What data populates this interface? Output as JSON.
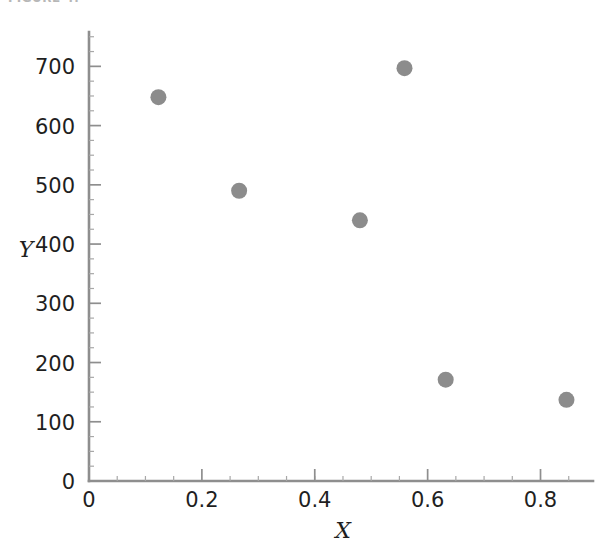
{
  "figure": {
    "caption_fragment": "FIGURE  4.",
    "background_color": "#ffffff"
  },
  "chart_data": {
    "type": "scatter",
    "title": "",
    "xlabel": "X",
    "ylabel": "Y",
    "xlim": [
      0,
      0.893
    ],
    "ylim": [
      0,
      758
    ],
    "grid": false,
    "legend": "none",
    "marker": {
      "shape": "circle",
      "color": "#8c8c8c",
      "radius_px": 8
    },
    "xticks": [
      "0",
      "0.2",
      "0.4",
      "0.6",
      "0.8"
    ],
    "xtick_values": [
      0,
      0.2,
      0.4,
      0.6,
      0.8
    ],
    "xtick_minor_step": 0.05,
    "yticks": [
      "0",
      "100",
      "200",
      "300",
      "400",
      "500",
      "600",
      "700"
    ],
    "ytick_values": [
      0,
      100,
      200,
      300,
      400,
      500,
      600,
      700
    ],
    "ytick_minor_step": 25,
    "x": [
      0.123,
      0.266,
      0.48,
      0.559,
      0.632,
      0.846
    ],
    "y": [
      648,
      490,
      440,
      697,
      171,
      137
    ],
    "points": [
      {
        "x": 0.123,
        "y": 648
      },
      {
        "x": 0.266,
        "y": 490
      },
      {
        "x": 0.48,
        "y": 440
      },
      {
        "x": 0.559,
        "y": 697
      },
      {
        "x": 0.632,
        "y": 171
      },
      {
        "x": 0.846,
        "y": 137
      }
    ],
    "axis_color": "#8e8e8e",
    "text_color": "#1f1f1f"
  }
}
